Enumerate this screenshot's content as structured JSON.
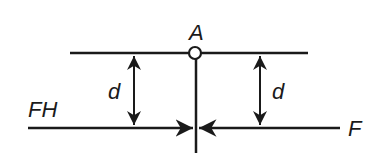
{
  "diagram": {
    "labels": {
      "pivot": "A",
      "left_distance": "d",
      "right_distance": "d",
      "left_force": "FH",
      "right_force": "F"
    },
    "colors": {
      "stroke": "#1a1a1a",
      "background": "#ffffff"
    }
  }
}
